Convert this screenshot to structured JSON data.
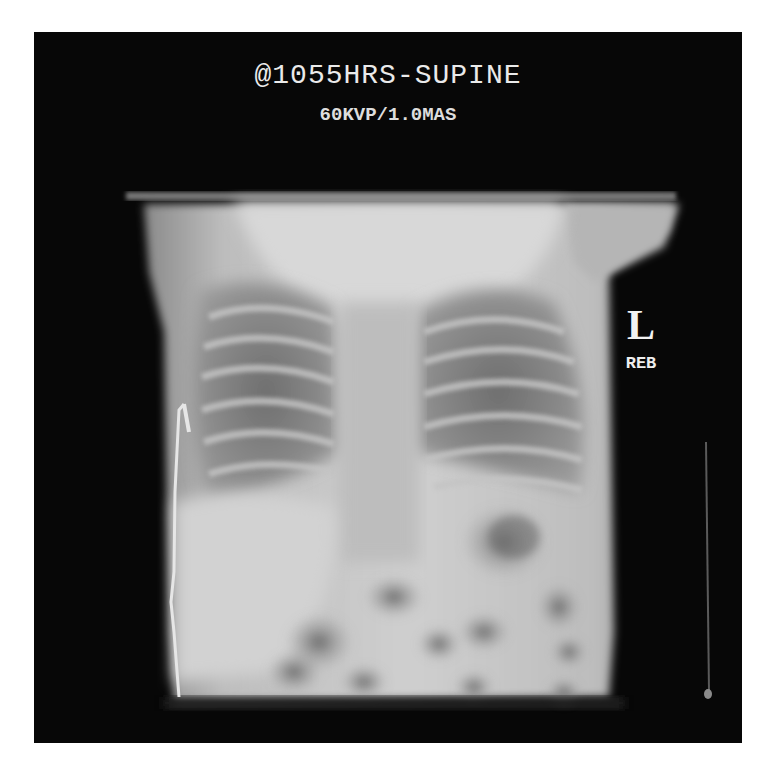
{
  "image": {
    "type": "neonatal chest and abdomen radiograph",
    "background_color": "#ffffff",
    "film_color": "#070707"
  },
  "overlay": {
    "title": "@1055HRS-SUPINE",
    "exposure": "60KVP/1.0MAS",
    "side_marker": "L",
    "tech_initials": "REB"
  }
}
